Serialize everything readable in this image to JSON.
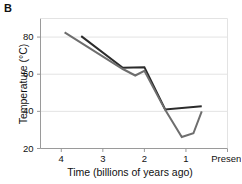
{
  "figure": {
    "panel_label": "B"
  },
  "chart_data": {
    "type": "line",
    "title": "",
    "xlabel": "Time (billions of years ago)",
    "ylabel": "Temperature (°C)",
    "xlim": [
      4.5,
      0.0
    ],
    "ylim": [
      20,
      90
    ],
    "x_axis_reversed": true,
    "grid": true,
    "grid_axis": "y",
    "legend": "none",
    "xticks": [
      {
        "value": 4,
        "label": "4"
      },
      {
        "value": 3,
        "label": "3"
      },
      {
        "value": 2,
        "label": "2"
      },
      {
        "value": 1,
        "label": "1"
      },
      {
        "value": 0,
        "label": "Present"
      }
    ],
    "yticks": [
      {
        "value": 20,
        "label": "20"
      },
      {
        "value": 40,
        "label": "40"
      },
      {
        "value": 60,
        "label": "60"
      },
      {
        "value": 80,
        "label": "80"
      }
    ],
    "series": [
      {
        "name": "upper-estimate-line",
        "color": "#2b2b2b",
        "width": 2.0,
        "points": [
          {
            "x": 3.52,
            "y": 80.5
          },
          {
            "x": 2.52,
            "y": 63.5
          },
          {
            "x": 2.0,
            "y": 63.8
          },
          {
            "x": 1.5,
            "y": 41.0
          },
          {
            "x": 0.62,
            "y": 42.8
          }
        ]
      },
      {
        "name": "lower-estimate-line",
        "color": "#6e6e6e",
        "width": 2.0,
        "points": [
          {
            "x": 3.92,
            "y": 82.5
          },
          {
            "x": 2.52,
            "y": 62.8
          },
          {
            "x": 2.22,
            "y": 59.3
          },
          {
            "x": 2.0,
            "y": 61.8
          },
          {
            "x": 1.5,
            "y": 40.8
          },
          {
            "x": 1.1,
            "y": 26.2
          },
          {
            "x": 0.82,
            "y": 28.2
          },
          {
            "x": 0.62,
            "y": 40.0
          }
        ]
      }
    ]
  },
  "colors": {
    "axis": "#9a9a9a",
    "grid": "#e3e3e3",
    "text": "#111111",
    "background": "#ffffff"
  }
}
